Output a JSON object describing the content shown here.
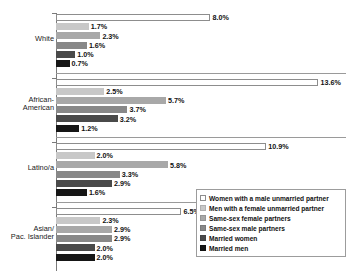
{
  "chart_data": {
    "type": "bar",
    "orientation": "horizontal",
    "title": "",
    "xlabel": "",
    "ylabel": "",
    "xlim": [
      0,
      15
    ],
    "grid": false,
    "legend_position": "bottom-right",
    "categories": [
      "White",
      "African-American",
      "Latino/a",
      "Asian/ Pac. Islander"
    ],
    "category_lines": [
      [
        "White"
      ],
      [
        "African-",
        "American"
      ],
      [
        "Latino/a"
      ],
      [
        "Asian/",
        "Pac. Islander"
      ]
    ],
    "series": [
      {
        "name": "Women with a male unmarried partner",
        "color": "#ffffff",
        "values": [
          8.0,
          13.6,
          10.9,
          6.5
        ],
        "labels": [
          "8.0%",
          "13.6%",
          "10.9%",
          "6.5%"
        ]
      },
      {
        "name": "Men with a female unmarried partner",
        "color": "#c8c8c8",
        "values": [
          1.7,
          2.5,
          2.0,
          2.3
        ],
        "labels": [
          "1.7%",
          "2.5%",
          "2.0%",
          "2.3%"
        ]
      },
      {
        "name": "Same-sex female partners",
        "color": "#a8a8a8",
        "values": [
          2.3,
          5.7,
          5.8,
          2.9
        ],
        "labels": [
          "2.3%",
          "5.7%",
          "5.8%",
          "2.9%"
        ]
      },
      {
        "name": "Same-sex male partners",
        "color": "#888888",
        "values": [
          1.6,
          3.7,
          3.3,
          2.9
        ],
        "labels": [
          "1.6%",
          "3.7%",
          "3.3%",
          "2.9%"
        ]
      },
      {
        "name": "Married women",
        "color": "#4a4a4a",
        "values": [
          1.0,
          3.2,
          2.9,
          2.0
        ],
        "labels": [
          "1.0%",
          "3.2%",
          "2.9%",
          "2.0%"
        ]
      },
      {
        "name": "Married men",
        "color": "#161616",
        "values": [
          0.7,
          1.2,
          1.6,
          2.0
        ],
        "labels": [
          "0.7%",
          "1.2%",
          "1.6%",
          "2.0%"
        ]
      }
    ]
  },
  "legend": {
    "items": [
      {
        "label": "Women with a male unmarried partner"
      },
      {
        "label": "Men with a female unmarried partner"
      },
      {
        "label": "Same-sex female partners"
      },
      {
        "label": "Same-sex male partners"
      },
      {
        "label": "Married women"
      },
      {
        "label": "Married men"
      }
    ]
  }
}
